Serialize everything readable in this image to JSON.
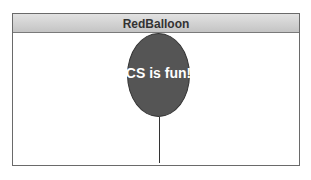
{
  "window": {
    "title": "RedBalloon"
  },
  "balloon": {
    "text": "CS is fun!",
    "color": "#555555"
  }
}
